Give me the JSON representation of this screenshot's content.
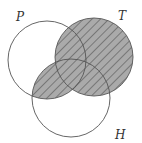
{
  "diagram": {
    "type": "venn",
    "sets": [
      {
        "id": "P",
        "label": "P"
      },
      {
        "id": "T",
        "label": "T"
      },
      {
        "id": "H",
        "label": "H"
      }
    ],
    "shaded_regions": [
      "T",
      "P ∩ H"
    ],
    "shade_color": "#aaaaaa",
    "hatch_color": "#444444"
  }
}
